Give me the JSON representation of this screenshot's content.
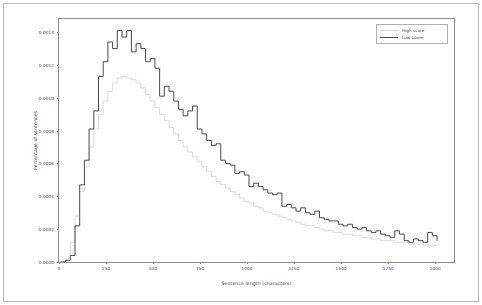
{
  "chart_data": {
    "type": "line",
    "title": "",
    "xlabel": "Sentence length (characters)",
    "ylabel": "Percentage of sentences",
    "xlim": [
      0,
      2100
    ],
    "ylim": [
      0,
      0.00148
    ],
    "xticks": [
      0,
      250,
      500,
      750,
      1000,
      1250,
      1500,
      1750,
      2000
    ],
    "xtick_labels": [
      "0",
      "250",
      "500",
      "750",
      "1000",
      "1250",
      "1500",
      "1750",
      "2000"
    ],
    "yticks": [
      0.0,
      0.0002,
      0.0004,
      0.0006,
      0.0008,
      0.001,
      0.0012,
      0.0014
    ],
    "ytick_labels": [
      "0.0000",
      "0.0002",
      "0.0004",
      "0.0006",
      "0.0008",
      "0.0010",
      "0.0012",
      "0.0014"
    ],
    "grid": false,
    "legend_position": "top-right",
    "drawstyle": "steps",
    "series": [
      {
        "name": "High score",
        "color": "#d9d9d9",
        "x": [
          10,
          35,
          60,
          85,
          110,
          135,
          160,
          185,
          210,
          235,
          260,
          285,
          310,
          335,
          360,
          385,
          410,
          435,
          460,
          485,
          510,
          535,
          560,
          585,
          610,
          635,
          660,
          685,
          710,
          735,
          760,
          785,
          810,
          835,
          860,
          885,
          910,
          935,
          960,
          985,
          1010,
          1035,
          1060,
          1085,
          1110,
          1135,
          1160,
          1185,
          1210,
          1235,
          1260,
          1285,
          1310,
          1335,
          1360,
          1385,
          1410,
          1435,
          1460,
          1485,
          1510,
          1535,
          1560,
          1585,
          1610,
          1635,
          1660,
          1685,
          1710,
          1735,
          1760,
          1785,
          1810,
          1835,
          1860,
          1885,
          1910,
          1935,
          1960,
          1985,
          2010
        ],
        "y": [
          0.0,
          2e-05,
          0.00012,
          0.00028,
          0.00043,
          0.00058,
          0.0007,
          0.00081,
          0.0009,
          0.00098,
          0.00104,
          0.00109,
          0.00112,
          0.00113,
          0.00112,
          0.00111,
          0.00109,
          0.00106,
          0.00102,
          0.00098,
          0.00094,
          0.0009,
          0.00086,
          0.00082,
          0.00078,
          0.00074,
          0.0007,
          0.00067,
          0.00064,
          0.00061,
          0.00058,
          0.00055,
          0.00052,
          0.00049,
          0.00047,
          0.00045,
          0.00043,
          0.00041,
          0.00039,
          0.00037,
          0.00036,
          0.00034,
          0.00033,
          0.00031,
          0.0003,
          0.00029,
          0.00028,
          0.00027,
          0.00026,
          0.00025,
          0.00024,
          0.00023,
          0.00022,
          0.00022,
          0.00021,
          0.0002,
          0.00019,
          0.00019,
          0.00018,
          0.00018,
          0.00017,
          0.00017,
          0.00016,
          0.00016,
          0.00015,
          0.00015,
          0.00014,
          0.00014,
          0.00013,
          0.00013,
          0.00013,
          0.00012,
          0.00012,
          0.00012,
          0.00011,
          0.00011,
          0.00011,
          0.0001,
          0.0001,
          0.0001,
          0.0001
        ]
      },
      {
        "name": "Low score",
        "color": "#4a4a4a",
        "x": [
          10,
          35,
          60,
          85,
          110,
          135,
          160,
          185,
          210,
          235,
          260,
          285,
          310,
          335,
          360,
          385,
          410,
          435,
          460,
          485,
          510,
          535,
          560,
          585,
          610,
          635,
          660,
          685,
          710,
          735,
          760,
          785,
          810,
          835,
          860,
          885,
          910,
          935,
          960,
          985,
          1010,
          1035,
          1060,
          1085,
          1110,
          1135,
          1160,
          1185,
          1210,
          1235,
          1260,
          1285,
          1310,
          1335,
          1360,
          1385,
          1410,
          1435,
          1460,
          1485,
          1510,
          1535,
          1560,
          1585,
          1610,
          1635,
          1660,
          1685,
          1710,
          1735,
          1760,
          1785,
          1810,
          1835,
          1860,
          1885,
          1910,
          1935,
          1960,
          1985,
          2010
        ],
        "y": [
          0.0,
          1e-05,
          4e-05,
          0.00022,
          0.00047,
          0.00062,
          0.00081,
          0.00092,
          0.00113,
          0.00122,
          0.00134,
          0.0013,
          0.00141,
          0.00137,
          0.00141,
          0.00128,
          0.00133,
          0.0013,
          0.00122,
          0.00124,
          0.00118,
          0.00101,
          0.00107,
          0.00104,
          0.00098,
          0.00093,
          0.00089,
          0.00092,
          0.00095,
          0.00081,
          0.00078,
          0.00074,
          0.00071,
          0.00072,
          0.00062,
          0.0006,
          0.00059,
          0.00054,
          0.00055,
          0.00053,
          0.00046,
          0.00048,
          0.00046,
          0.00044,
          0.00042,
          0.00041,
          0.00042,
          0.00034,
          0.00035,
          0.00033,
          0.00031,
          0.00033,
          0.0003,
          0.00029,
          0.00031,
          0.00027,
          0.00026,
          0.00025,
          0.00025,
          0.00023,
          0.00022,
          0.00023,
          0.00021,
          0.0002,
          0.00021,
          0.00019,
          0.00018,
          0.00019,
          0.00017,
          0.00016,
          0.00015,
          0.00019,
          0.00017,
          0.00013,
          0.00012,
          0.00014,
          0.00013,
          0.00012,
          0.00018,
          0.00016,
          0.00013
        ]
      }
    ]
  },
  "legend": {
    "entries": [
      {
        "label": "High score",
        "color": "#d9d9d9"
      },
      {
        "label": "Low score",
        "color": "#4a4a4a"
      }
    ]
  }
}
